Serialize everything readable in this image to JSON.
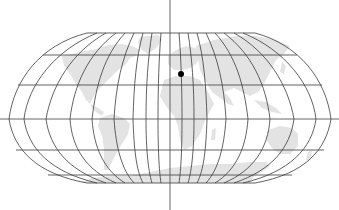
{
  "map": {
    "title": "World map, Robinson projection, with a marked location",
    "projection": "Robinson",
    "colors": {
      "background": "#ffffff",
      "land": "#e3e3e3",
      "graticule": "#3a3a3a",
      "axis": "#555555",
      "marker": "#000000"
    },
    "graticule": {
      "parallels_y": [
        33,
        55,
        85,
        119,
        150,
        175,
        183
      ],
      "meridian_count": 17,
      "equator_y": 119,
      "central_meridian_x": 170
    },
    "marker": {
      "label": "Marked location (North Africa / Mediterranean)",
      "x": 181,
      "y": 74,
      "radius": 3
    }
  }
}
